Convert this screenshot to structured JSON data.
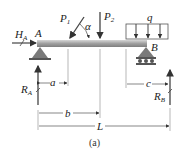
{
  "figure": {
    "caption": "(a)",
    "beam": {
      "color": "#8e8e8e",
      "highlight": "#d6d6d6"
    },
    "support_color": "#7a7a7a",
    "labels": {
      "HA_main": "H",
      "HA_sub": "A",
      "A": "A",
      "B": "B",
      "P1_main": "P",
      "P1_sub": "1",
      "P2_main": "P",
      "P2_sub": "2",
      "alpha": "α",
      "q": "q",
      "RA_main": "R",
      "RA_sub": "A",
      "RB_main": "R",
      "RB_sub": "B",
      "a": "a",
      "b": "b",
      "c": "c",
      "L": "L"
    }
  }
}
